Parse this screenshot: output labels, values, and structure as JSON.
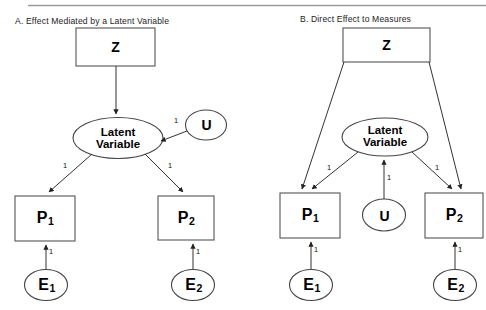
{
  "figure": {
    "top_rule": true,
    "panels": [
      {
        "id": "A",
        "title": "A. Effect Mediated by a Latent Variable",
        "nodes": {
          "z": "Z",
          "latent_line1": "Latent",
          "latent_line2": "Variable",
          "u": "U",
          "p1_base": "P",
          "p1_sub": "1",
          "p2_base": "P",
          "p2_sub": "2",
          "e1_base": "E",
          "e1_sub": "1",
          "e2_base": "E",
          "e2_sub": "2"
        },
        "edge_labels": {
          "u_to_latent": "1",
          "latent_to_p1": "1",
          "latent_to_p2": "1",
          "e1_to_p1": "1",
          "e2_to_p2": "1"
        }
      },
      {
        "id": "B",
        "title": "B. Direct Effect to Measures",
        "nodes": {
          "z": "Z",
          "latent_line1": "Latent",
          "latent_line2": "Variable",
          "u": "U",
          "p1_base": "P",
          "p1_sub": "1",
          "p2_base": "P",
          "p2_sub": "2",
          "e1_base": "E",
          "e1_sub": "1",
          "e2_base": "E",
          "e2_sub": "2"
        },
        "edge_labels": {
          "u_to_latent": "1",
          "latent_to_p1": "1",
          "latent_to_p2": "1",
          "e1_to_p1": "1",
          "e2_to_p2": "1"
        }
      }
    ],
    "colors": {
      "stroke": "#4a4a4a",
      "text": "#000000",
      "background": "#ffffff",
      "rule": "#9a9a9a"
    }
  }
}
